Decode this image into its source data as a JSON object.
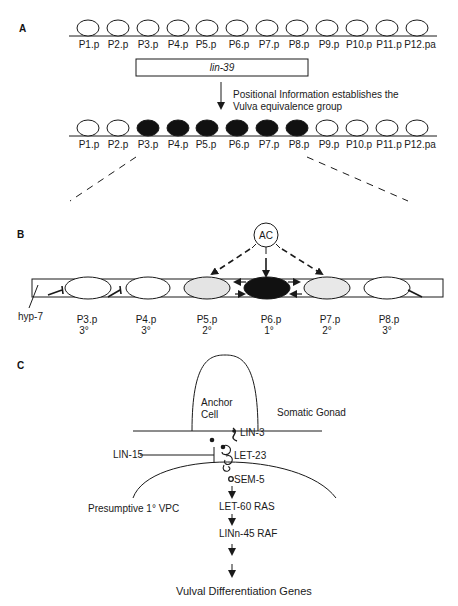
{
  "panel_a": {
    "label": "A",
    "top_row_cells": [
      "P1.p",
      "P2.p",
      "P3.p",
      "P4.p",
      "P5.p",
      "P6.p",
      "P7.p",
      "P8.p",
      "P9.p",
      "P10.p",
      "P11.p",
      "P12.pa"
    ],
    "gene_box": "lin-39",
    "arrow_text_line1": "Positional Information establishes the",
    "arrow_text_line2": "Vulva equivalence group",
    "bottom_row_cells": [
      "P1.p",
      "P2.p",
      "P3.p",
      "P4.p",
      "P5.p",
      "P6.p",
      "P7.p",
      "P8.p",
      "P9.p",
      "P10.p",
      "P11.p",
      "P12.pa"
    ],
    "filled_cells": [
      "P3.p",
      "P4.p",
      "P5.p",
      "P6.p",
      "P7.p",
      "P8.p"
    ]
  },
  "panel_b": {
    "label": "B",
    "signal_source": "AC",
    "tissue_label": "hyp-7",
    "cells": [
      {
        "name": "P3.p",
        "fate": "3°"
      },
      {
        "name": "P4.p",
        "fate": "3°"
      },
      {
        "name": "P5.p",
        "fate": "2°"
      },
      {
        "name": "P6.p",
        "fate": "1°"
      },
      {
        "name": "P7.p",
        "fate": "2°"
      },
      {
        "name": "P8.p",
        "fate": "3°"
      }
    ]
  },
  "panel_c": {
    "label": "C",
    "anchor_cell_line1": "Anchor",
    "anchor_cell_line2": "Cell",
    "somatic_gonad": "Somatic Gonad",
    "lin3": "LIN-3",
    "lin15": "LIN-15",
    "let23": "LET-23",
    "sem5": "SEM-5",
    "vpc": "Presumptive 1° VPC",
    "let60": "LET-60 RAS",
    "lin45": "LINn-45 RAF",
    "output": "Vulval Differentiation Genes"
  },
  "colors": {
    "stroke": "#1a1a1a",
    "filled_cell": "#111111",
    "secondary_cell": "#e4e4e4",
    "background": "#ffffff"
  }
}
